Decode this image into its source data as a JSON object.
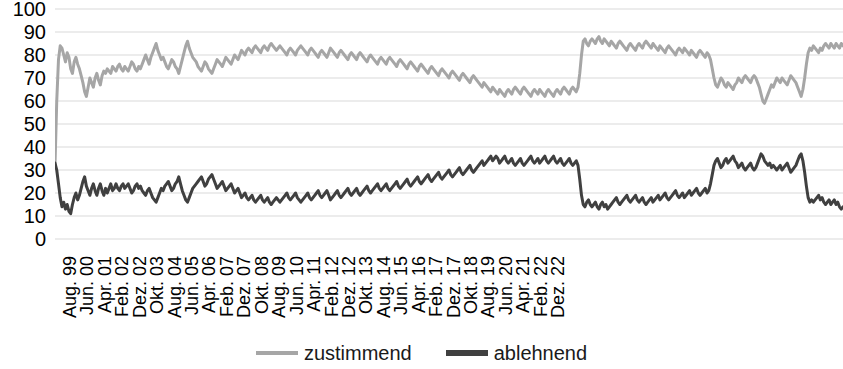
{
  "chart_data": {
    "type": "line",
    "title": "",
    "subtitle": "",
    "xlabel": "",
    "ylabel": "",
    "ylim": [
      0,
      100
    ],
    "ytick_step": 10,
    "yticks": [
      100,
      90,
      80,
      70,
      60,
      50,
      40,
      30,
      20,
      10,
      0
    ],
    "grid": true,
    "grid_color": "#d9d9d9",
    "legend_position": "bottom-center",
    "x_tick_labels": [
      "Aug. 99",
      "Jun. 00",
      "Apr. 01",
      "Feb. 02",
      "Dez. 02",
      "Okt. 03",
      "Aug. 04",
      "Jun. 05",
      "Apr. 06",
      "Feb. 07",
      "Dez. 07",
      "Okt. 08",
      "Aug. 09",
      "Jun. 10",
      "Apr. 11",
      "Feb. 12",
      "Dez. 12",
      "Okt. 13",
      "Aug. 14",
      "Jun. 15",
      "Apr. 16",
      "Feb. 17",
      "Dez. 17",
      "Okt. 18",
      "Aug. 19",
      "Jun. 20",
      "Apr. 21",
      "Feb. 22",
      "Dez. 22"
    ],
    "x_tick_interval_months": 10,
    "series": [
      {
        "name": "zustimmend",
        "color": "#a6a6a6",
        "width": 3,
        "values": [
          32,
          60,
          78,
          84,
          83,
          80,
          77,
          81,
          79,
          74,
          72,
          77,
          79,
          76,
          74,
          71,
          68,
          64,
          62,
          66,
          70,
          68,
          66,
          70,
          72,
          69,
          67,
          71,
          73,
          72,
          74,
          73,
          72,
          75,
          74,
          73,
          75,
          76,
          74,
          73,
          75,
          74,
          73,
          75,
          77,
          76,
          74,
          73,
          75,
          74,
          76,
          78,
          80,
          78,
          76,
          79,
          81,
          83,
          85,
          82,
          80,
          78,
          79,
          77,
          75,
          74,
          76,
          78,
          77,
          75,
          74,
          72,
          75,
          78,
          81,
          84,
          86,
          83,
          81,
          79,
          78,
          77,
          75,
          74,
          73,
          75,
          77,
          76,
          74,
          73,
          72,
          74,
          76,
          78,
          77,
          76,
          75,
          77,
          79,
          78,
          77,
          76,
          78,
          80,
          79,
          78,
          80,
          82,
          81,
          80,
          82,
          83,
          82,
          81,
          83,
          84,
          83,
          82,
          81,
          83,
          84,
          83,
          82,
          84,
          85,
          84,
          83,
          82,
          83,
          84,
          83,
          82,
          81,
          80,
          82,
          83,
          82,
          81,
          80,
          82,
          83,
          84,
          83,
          82,
          81,
          80,
          82,
          83,
          82,
          81,
          80,
          79,
          81,
          82,
          81,
          80,
          79,
          81,
          83,
          82,
          81,
          80,
          79,
          81,
          82,
          81,
          80,
          79,
          78,
          80,
          81,
          80,
          79,
          78,
          80,
          81,
          80,
          79,
          78,
          77,
          79,
          80,
          79,
          78,
          77,
          76,
          78,
          79,
          78,
          77,
          76,
          78,
          79,
          78,
          77,
          76,
          75,
          77,
          78,
          77,
          76,
          75,
          74,
          76,
          77,
          76,
          75,
          74,
          73,
          75,
          76,
          75,
          74,
          73,
          72,
          74,
          75,
          74,
          73,
          72,
          71,
          73,
          74,
          73,
          72,
          71,
          70,
          72,
          73,
          72,
          71,
          70,
          69,
          71,
          72,
          71,
          70,
          69,
          68,
          70,
          71,
          70,
          69,
          68,
          67,
          66,
          68,
          67,
          66,
          65,
          64,
          66,
          65,
          64,
          63,
          65,
          64,
          63,
          62,
          64,
          65,
          64,
          63,
          65,
          66,
          65,
          64,
          63,
          65,
          66,
          65,
          64,
          63,
          62,
          64,
          65,
          64,
          63,
          65,
          64,
          63,
          62,
          64,
          65,
          64,
          63,
          62,
          64,
          65,
          64,
          63,
          65,
          66,
          65,
          64,
          63,
          65,
          66,
          65,
          64,
          66,
          72,
          80,
          86,
          87,
          85,
          84,
          86,
          87,
          86,
          85,
          87,
          88,
          86,
          85,
          87,
          86,
          85,
          84,
          86,
          85,
          84,
          83,
          85,
          86,
          85,
          84,
          83,
          82,
          84,
          85,
          84,
          83,
          82,
          84,
          85,
          84,
          83,
          85,
          86,
          85,
          84,
          83,
          85,
          84,
          83,
          82,
          84,
          83,
          82,
          81,
          83,
          84,
          83,
          82,
          81,
          80,
          82,
          83,
          82,
          81,
          83,
          82,
          81,
          80,
          82,
          81,
          80,
          79,
          81,
          82,
          81,
          80,
          79,
          81,
          80,
          78,
          74,
          70,
          67,
          66,
          68,
          70,
          69,
          67,
          66,
          68,
          67,
          66,
          65,
          67,
          68,
          70,
          69,
          68,
          70,
          71,
          70,
          69,
          68,
          70,
          71,
          70,
          68,
          66,
          63,
          60,
          59,
          61,
          63,
          65,
          67,
          66,
          68,
          70,
          69,
          68,
          70,
          69,
          68,
          67,
          69,
          71,
          70,
          69,
          68,
          66,
          64,
          62,
          65,
          70,
          76,
          81,
          83,
          82,
          84,
          83,
          82,
          81,
          83,
          82,
          84,
          85,
          84,
          83,
          85,
          84,
          83,
          85,
          84,
          83,
          85,
          84
        ]
      },
      {
        "name": "ablehnend",
        "color": "#404040",
        "width": 3,
        "values": [
          33,
          30,
          24,
          18,
          14,
          16,
          13,
          15,
          12,
          11,
          15,
          18,
          20,
          17,
          19,
          22,
          25,
          27,
          23,
          21,
          19,
          22,
          24,
          21,
          19,
          22,
          24,
          21,
          19,
          22,
          20,
          22,
          24,
          21,
          22,
          24,
          22,
          21,
          23,
          24,
          22,
          23,
          24,
          22,
          20,
          21,
          23,
          24,
          22,
          23,
          21,
          20,
          19,
          21,
          22,
          20,
          18,
          17,
          16,
          18,
          20,
          22,
          21,
          23,
          24,
          25,
          23,
          21,
          22,
          24,
          25,
          27,
          24,
          21,
          19,
          17,
          16,
          18,
          20,
          22,
          23,
          24,
          25,
          26,
          27,
          25,
          23,
          24,
          26,
          27,
          28,
          26,
          24,
          22,
          23,
          24,
          25,
          23,
          21,
          22,
          23,
          24,
          22,
          20,
          21,
          22,
          20,
          18,
          19,
          20,
          18,
          17,
          18,
          19,
          17,
          16,
          17,
          18,
          19,
          17,
          16,
          17,
          18,
          16,
          15,
          16,
          17,
          18,
          17,
          16,
          17,
          18,
          19,
          20,
          18,
          17,
          18,
          19,
          20,
          18,
          17,
          16,
          17,
          18,
          19,
          20,
          18,
          17,
          18,
          19,
          20,
          21,
          19,
          18,
          19,
          20,
          21,
          19,
          17,
          18,
          19,
          20,
          21,
          19,
          18,
          19,
          20,
          21,
          22,
          20,
          19,
          20,
          21,
          22,
          20,
          19,
          20,
          21,
          22,
          23,
          21,
          20,
          21,
          22,
          23,
          24,
          22,
          21,
          22,
          23,
          24,
          22,
          21,
          22,
          23,
          24,
          25,
          23,
          22,
          23,
          24,
          25,
          26,
          24,
          23,
          24,
          25,
          26,
          27,
          25,
          24,
          25,
          26,
          27,
          28,
          26,
          25,
          26,
          27,
          28,
          29,
          27,
          26,
          27,
          28,
          29,
          30,
          28,
          27,
          28,
          29,
          30,
          31,
          29,
          28,
          29,
          30,
          31,
          32,
          30,
          29,
          30,
          31,
          32,
          33,
          34,
          32,
          33,
          34,
          35,
          36,
          34,
          35,
          36,
          35,
          33,
          34,
          35,
          36,
          34,
          33,
          34,
          35,
          33,
          32,
          33,
          34,
          35,
          33,
          32,
          33,
          34,
          35,
          36,
          34,
          33,
          34,
          35,
          33,
          34,
          35,
          36,
          34,
          33,
          34,
          35,
          36,
          34,
          33,
          34,
          35,
          33,
          32,
          33,
          34,
          35,
          33,
          32,
          33,
          34,
          32,
          26,
          19,
          15,
          14,
          16,
          17,
          15,
          14,
          15,
          16,
          14,
          13,
          15,
          16,
          14,
          15,
          13,
          14,
          15,
          16,
          17,
          18,
          16,
          15,
          16,
          17,
          18,
          19,
          17,
          16,
          17,
          18,
          19,
          17,
          16,
          17,
          18,
          16,
          15,
          16,
          17,
          18,
          16,
          17,
          18,
          19,
          17,
          18,
          19,
          20,
          18,
          17,
          18,
          19,
          20,
          21,
          19,
          18,
          19,
          20,
          18,
          19,
          20,
          21,
          19,
          20,
          21,
          22,
          20,
          19,
          20,
          21,
          22,
          20,
          21,
          24,
          28,
          32,
          34,
          35,
          33,
          31,
          32,
          34,
          35,
          33,
          34,
          35,
          36,
          34,
          33,
          31,
          32,
          33,
          31,
          30,
          31,
          32,
          33,
          31,
          30,
          31,
          33,
          35,
          37,
          36,
          34,
          33,
          32,
          33,
          31,
          32,
          31,
          30,
          31,
          32,
          30,
          31,
          32,
          33,
          31,
          29,
          30,
          31,
          32,
          34,
          36,
          37,
          34,
          29,
          23,
          18,
          16,
          17,
          16,
          17,
          18,
          19,
          17,
          18,
          16,
          15,
          16,
          17,
          15,
          16,
          17,
          15,
          16,
          14,
          13,
          14
        ]
      }
    ]
  },
  "legend": {
    "entries": [
      {
        "label": "zustimmend",
        "color": "#a6a6a6",
        "name": "legend-zustimmend"
      },
      {
        "label": "ablehnend",
        "color": "#404040",
        "name": "legend-ablehnend"
      }
    ]
  },
  "axis": {
    "y_labels": [
      "100",
      "90",
      "80",
      "70",
      "60",
      "50",
      "40",
      "30",
      "20",
      "10",
      "0"
    ]
  }
}
